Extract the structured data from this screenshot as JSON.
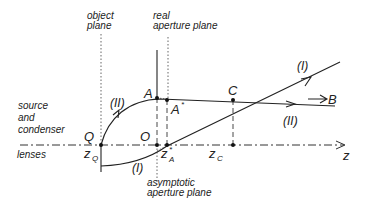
{
  "labels": {
    "object_plane": [
      "object",
      "plane"
    ],
    "real_aperture_plane": [
      "real",
      "aperture plane"
    ],
    "asymptotic_aperture_plane": [
      "asymptotic",
      "aperture plane"
    ],
    "source_condenser": [
      "source",
      "and",
      "condenser"
    ],
    "lenses": "lenses",
    "point_Q": "Q",
    "point_O": "O",
    "point_A": "A",
    "point_A_star": "A",
    "star": "*",
    "point_C": "C",
    "axis_z": "z",
    "z_Q": "z",
    "z_Q_sub": "Q",
    "z_A": "z",
    "z_A_sub": "A",
    "z_C": "z",
    "z_C_sub": "C",
    "ray_I_top": "(I)",
    "ray_I_bottom": "(I)",
    "ray_II_left": "(II)",
    "ray_II_right": "(II)",
    "field_B": "B"
  }
}
